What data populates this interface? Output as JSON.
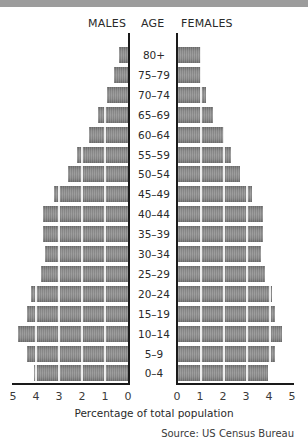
{
  "header": {
    "males_label": "MALES",
    "age_label": "AGE",
    "females_label": "FEMALES"
  },
  "footer": {
    "xlabel": "Percentage of total population",
    "source": "Source: US Census Bureau"
  },
  "colors": {
    "bar": "#858585",
    "axis": "#1a1a1a",
    "top_strip": "#9c9c9c"
  },
  "chart_data": {
    "type": "bar",
    "subtype": "population-pyramid",
    "title": "",
    "xlabel": "Percentage of total population",
    "ylabel": "AGE",
    "categories": [
      "80+",
      "75–79",
      "70–74",
      "65–69",
      "60–64",
      "55–59",
      "50–54",
      "45–49",
      "40–44",
      "35–39",
      "30–34",
      "25–29",
      "20–24",
      "15–19",
      "10–14",
      "5–9",
      "0–4"
    ],
    "series": [
      {
        "name": "MALES",
        "side": "left",
        "values": [
          0.4,
          0.6,
          0.9,
          1.3,
          1.7,
          2.2,
          2.6,
          3.2,
          3.7,
          3.7,
          3.6,
          3.8,
          4.2,
          4.4,
          4.8,
          4.4,
          4.1
        ]
      },
      {
        "name": "FEMALES",
        "side": "right",
        "values": [
          1.0,
          1.0,
          1.2,
          1.5,
          2.0,
          2.3,
          2.7,
          3.2,
          3.7,
          3.7,
          3.6,
          3.8,
          4.1,
          4.2,
          4.5,
          4.2,
          3.9
        ]
      }
    ],
    "male_ticks": [
      "5",
      "4",
      "3",
      "2",
      "1",
      "0"
    ],
    "female_ticks": [
      "0",
      "1",
      "2",
      "3",
      "4",
      "5"
    ],
    "xlim": [
      0,
      5
    ],
    "grid": "white vertical lines at each 1% inside bars",
    "legend": "none (side headers MALES / FEMALES)",
    "source": "Source: US Census Bureau"
  }
}
